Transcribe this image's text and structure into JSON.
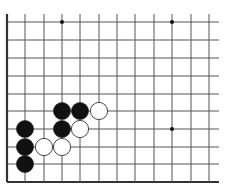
{
  "board": {
    "type": "go-diagram",
    "edges": [
      "left",
      "bottom"
    ],
    "columns_x": [
      7,
      25,
      44,
      62,
      80,
      99,
      117,
      135,
      154,
      172,
      191,
      209
    ],
    "rows_y": [
      22,
      40,
      58,
      76,
      94,
      111,
      129,
      147,
      164,
      182
    ],
    "line_extent": {
      "top": 14,
      "right": 219
    },
    "colors": {
      "line": "#555555",
      "edge": "#333333",
      "black_stone": "#111111",
      "white_stone": "#ffffff",
      "background": "#ffffff"
    },
    "star_points": [
      {
        "col": 3,
        "row": 0
      },
      {
        "col": 9,
        "row": 0
      },
      {
        "col": 9,
        "row": 6
      }
    ],
    "stones": [
      {
        "color": "black",
        "col": 1,
        "row": 6
      },
      {
        "color": "black",
        "col": 1,
        "row": 7
      },
      {
        "color": "black",
        "col": 1,
        "row": 8
      },
      {
        "color": "white",
        "col": 2,
        "row": 7
      },
      {
        "color": "white",
        "col": 3,
        "row": 7
      },
      {
        "color": "black",
        "col": 3,
        "row": 5
      },
      {
        "color": "black",
        "col": 4,
        "row": 5
      },
      {
        "color": "black",
        "col": 3,
        "row": 6
      },
      {
        "color": "white",
        "col": 5,
        "row": 5
      },
      {
        "color": "white",
        "col": 4,
        "row": 6
      }
    ]
  }
}
